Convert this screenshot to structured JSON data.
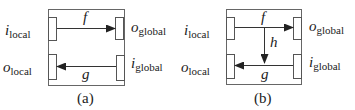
{
  "diagrams": [
    {
      "id": "a",
      "caption": "(a)",
      "left_labels": {
        "top": {
          "base": "i",
          "sub": "local"
        },
        "bottom": {
          "base": "o",
          "sub": "local"
        }
      },
      "right_labels": {
        "top": {
          "base": "o",
          "sub": "global"
        },
        "bottom": {
          "base": "i",
          "sub": "global"
        }
      },
      "arrows": [
        {
          "label": "f",
          "from": "i_local",
          "to": "o_global",
          "direction": "right"
        },
        {
          "label": "g",
          "from": "i_global",
          "to": "o_local",
          "direction": "left"
        }
      ]
    },
    {
      "id": "b",
      "caption": "(b)",
      "left_labels": {
        "top": {
          "base": "i",
          "sub": "local"
        },
        "bottom": {
          "base": "o",
          "sub": "local"
        }
      },
      "right_labels": {
        "top": {
          "base": "o",
          "sub": "global"
        },
        "bottom": {
          "base": "i",
          "sub": "global"
        }
      },
      "arrows": [
        {
          "label": "f",
          "from": "i_local",
          "to": "o_global",
          "direction": "right"
        },
        {
          "label": "h",
          "from": "f",
          "to": "g",
          "direction": "down"
        },
        {
          "label": "g",
          "from": "i_global",
          "to": "o_local",
          "direction": "left"
        }
      ]
    }
  ],
  "colors": {
    "stroke": "#333333",
    "box_stroke": "#555555"
  }
}
